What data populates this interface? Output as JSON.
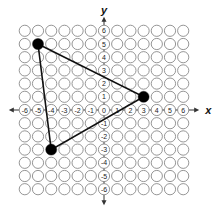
{
  "diagram": {
    "type": "coordinate-grid",
    "x_axis_label": "x",
    "y_axis_label": "y",
    "x_range": [
      -6,
      6
    ],
    "y_range": [
      -6,
      6
    ],
    "x_tick_labels": [
      "-6",
      "-5",
      "-4",
      "-3",
      "-2",
      "-1",
      "0",
      "1",
      "2",
      "3",
      "4",
      "5",
      "6"
    ],
    "y_tick_labels": [
      "6",
      "5",
      "4",
      "3",
      "2",
      "1",
      "-1",
      "-2",
      "-3",
      "-4",
      "-5",
      "-6"
    ],
    "triangle": {
      "vertices": [
        {
          "label": "top-left",
          "x": -5,
          "y": 5
        },
        {
          "label": "right",
          "x": 3,
          "y": 1
        },
        {
          "label": "bottom-left",
          "x": -4,
          "y": -3
        }
      ]
    },
    "colors": {
      "grid_circle": "#8a8a8a",
      "axis": "#333333",
      "triangle": "#111111",
      "vertex": "#000000"
    }
  }
}
